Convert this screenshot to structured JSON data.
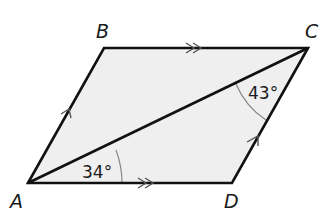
{
  "diagram": {
    "type": "parallelogram",
    "vertices": [
      {
        "name": "A",
        "x": 28,
        "y": 183
      },
      {
        "name": "B",
        "x": 104,
        "y": 48
      },
      {
        "name": "C",
        "x": 308,
        "y": 48
      },
      {
        "name": "D",
        "x": 232,
        "y": 183
      }
    ],
    "labels": {
      "A": "A",
      "B": "B",
      "C": "C",
      "D": "D"
    },
    "diagonal": "AC",
    "angles": {
      "at_A": "34°",
      "at_C": "43°"
    },
    "parallel_marks": {
      "AB_CD": "single arrow",
      "BC_AD": "double arrow"
    },
    "colors": {
      "fill": "#efefef",
      "stroke": "#111111",
      "arc": "#888888"
    }
  }
}
